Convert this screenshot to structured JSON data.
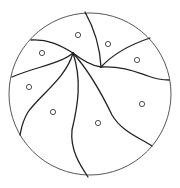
{
  "diagram": {
    "colors": {
      "stroke": "#222222",
      "background": "#ffffff",
      "boundary": "#444444"
    },
    "boundary_circle": {
      "cx": 90,
      "cy": 94,
      "r": 81
    },
    "edges": [
      {
        "id": "top",
        "d": "M85,12 C94,28 100,48 101,67"
      },
      {
        "id": "upper-right",
        "d": "M101,67 C115,52 132,44 150,38"
      },
      {
        "id": "right",
        "d": "M101,67 C122,66 136,72 148,76 C156,79 162,80 169,80"
      },
      {
        "id": "hub-to-junction",
        "d": "M73,53 C82,60 92,66 101,67"
      },
      {
        "id": "upper-left",
        "d": "M73,53 C60,45 48,39 31,40"
      },
      {
        "id": "left",
        "d": "M73,53 C60,64 35,67 12,77"
      },
      {
        "id": "lower-left",
        "d": "M73,53 C66,78 40,95 28,112 C22,122 21,130 20,135"
      },
      {
        "id": "bottom",
        "d": "M73,53 C82,80 78,105 72,130 C70,150 80,165 88,177"
      },
      {
        "id": "lower-right",
        "d": "M73,53 C88,70 100,90 112,115 C122,132 140,138 152,146"
      }
    ],
    "seed_points": [
      {
        "x": 78,
        "y": 35
      },
      {
        "x": 42,
        "y": 53
      },
      {
        "x": 108,
        "y": 44
      },
      {
        "x": 137,
        "y": 60
      },
      {
        "x": 29,
        "y": 87
      },
      {
        "x": 53,
        "y": 112
      },
      {
        "x": 98,
        "y": 123
      },
      {
        "x": 142,
        "y": 104
      }
    ],
    "seed_radius": 2.6
  }
}
